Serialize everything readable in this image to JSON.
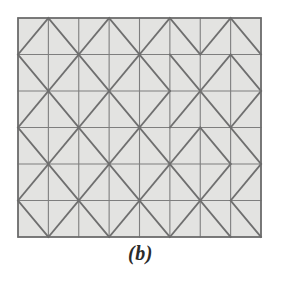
{
  "figure": {
    "caption": "(b)",
    "label_letter": "b",
    "type": "triangulated-square-lattice-diagram"
  },
  "colors": {
    "background": "#ffffff",
    "cell_fill": "#e3e3e1",
    "grid_line": "#7e7e7e",
    "diagonal_line": "#6f6f6f",
    "border_line": "#6a6a6a",
    "caption_text": "#2b2b2b"
  },
  "grid": {
    "columns": 8,
    "rows": 6,
    "x0": 18,
    "y0": 18,
    "x1": 261,
    "y1": 237,
    "cell_width": 30.375,
    "cell_height": 36.5,
    "grid_stroke_width": 1.1,
    "diagonal_stroke_width": 1.8,
    "border_stroke_width": 1.6
  },
  "chart_data": {
    "type": "heatmap",
    "title": "(b)",
    "xlabel": "",
    "ylabel": "",
    "categories": [
      "c1",
      "c2",
      "c3",
      "c4",
      "c5",
      "c6",
      "c7",
      "c8"
    ],
    "row_labels": [
      "r1",
      "r2",
      "r3",
      "r4",
      "r5",
      "r6"
    ],
    "legend": [],
    "diagonals": [
      [
        "/",
        "\\",
        "/",
        "\\",
        "/",
        "\\",
        "/",
        "\\"
      ],
      [
        "\\",
        "/",
        "\\",
        "/",
        "\\",
        "\\",
        "/",
        "\\"
      ],
      [
        "/",
        "\\",
        "/",
        "\\",
        "/",
        "/",
        "\\",
        "/"
      ],
      [
        "\\",
        "/",
        "\\",
        "/",
        "\\",
        "/",
        "\\",
        "\\"
      ],
      [
        "/",
        "\\",
        "/",
        "\\",
        "/",
        "\\",
        "/",
        "/"
      ],
      [
        "\\",
        "/",
        "\\",
        "/",
        "\\",
        "/",
        "\\",
        "\\"
      ]
    ]
  }
}
